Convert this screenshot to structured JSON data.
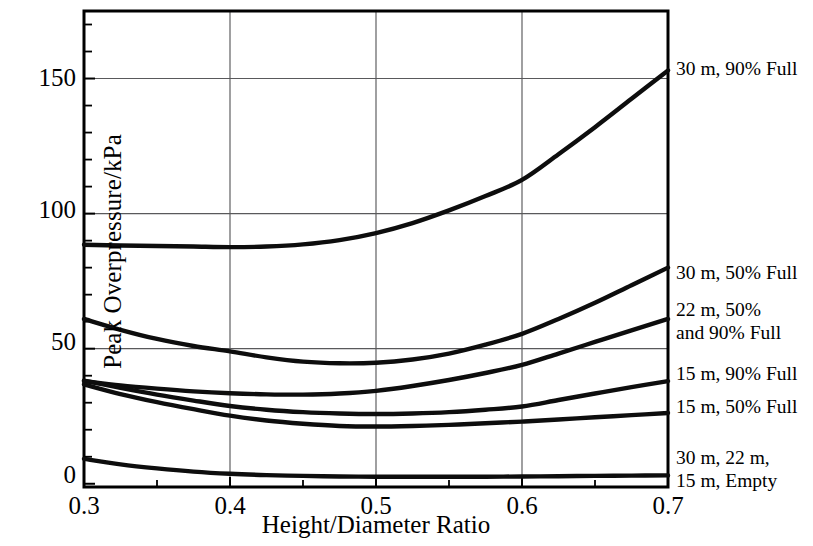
{
  "chart_data": {
    "type": "line",
    "title": "",
    "xlabel": "Height/Diameter Ratio",
    "ylabel": "Peak Overpressure/kPa",
    "xlim": [
      0.3,
      0.7
    ],
    "ylim": [
      -1.2,
      175
    ],
    "xticks": [
      0.3,
      0.4,
      0.5,
      0.6,
      0.7
    ],
    "xtick_labels": [
      "0.3",
      "0.4",
      "0.5",
      "0.6",
      "0.7"
    ],
    "yticks": [
      0,
      50,
      100,
      150
    ],
    "ytick_labels": [
      "0",
      "50",
      "100",
      "150"
    ],
    "y_minor_tick_step": 10,
    "grid": "horizontal-and-vertical",
    "legend_position": "right-of-axes-inline-annotations",
    "x": [
      0.3,
      0.325,
      0.35,
      0.375,
      0.4,
      0.425,
      0.45,
      0.475,
      0.5,
      0.525,
      0.55,
      0.575,
      0.6,
      0.625,
      0.65,
      0.675,
      0.7
    ],
    "series": [
      {
        "name": "30 m, 90% Full",
        "label": "30 m, 90% Full",
        "values": [
          88.5,
          88.2,
          88.0,
          87.8,
          87.6,
          87.8,
          88.6,
          90.2,
          92.8,
          96.5,
          101.2,
          106.5,
          112.5,
          122.0,
          132.0,
          142.5,
          153.0
        ]
      },
      {
        "name": "30 m, 50% Full",
        "label": "30 m, 50% Full",
        "values": [
          61.0,
          57.0,
          53.6,
          51.0,
          49.0,
          46.8,
          45.2,
          44.6,
          44.8,
          46.0,
          48.2,
          51.5,
          55.5,
          61.0,
          67.0,
          73.5,
          80.0
        ]
      },
      {
        "name": "22 m, 50%\nand 90% Full",
        "label_lines": [
          "22 m, 50%",
          "and 90% Full"
        ],
        "values": [
          38.0,
          36.4,
          35.2,
          34.2,
          33.5,
          33.1,
          33.0,
          33.4,
          34.4,
          36.2,
          38.4,
          41.0,
          44.0,
          48.2,
          52.5,
          56.8,
          61.0
        ]
      },
      {
        "name": "15 m, 90% Full",
        "label": "15 m, 90% Full",
        "values": [
          38.2,
          35.5,
          33.0,
          30.8,
          28.8,
          27.4,
          26.5,
          26.0,
          25.8,
          26.0,
          26.5,
          27.4,
          28.6,
          31.0,
          33.4,
          35.8,
          38.0
        ]
      },
      {
        "name": "15 m, 50% Full",
        "label": "15 m, 50% Full",
        "values": [
          36.8,
          33.2,
          30.2,
          27.6,
          25.2,
          23.4,
          22.2,
          21.4,
          21.2,
          21.4,
          21.8,
          22.4,
          23.0,
          23.8,
          24.6,
          25.4,
          26.2
        ]
      },
      {
        "name": "30 m, 22 m, 15 m, Empty",
        "label_lines": [
          "30 m, 22 m,",
          "15 m, Empty"
        ],
        "values": [
          9.2,
          7.2,
          5.7,
          4.5,
          3.7,
          3.2,
          2.9,
          2.7,
          2.6,
          2.6,
          2.6,
          2.6,
          2.7,
          2.8,
          2.9,
          3.0,
          3.1
        ]
      }
    ],
    "annotations": [
      {
        "text": "30 m, 90% Full",
        "at_y": 153.0
      },
      {
        "text": "30 m, 50% Full",
        "at_y": 80.0
      },
      {
        "text": "22 m, 50% and 90% Full",
        "at_y": 61.0
      },
      {
        "text": "15 m, 90% Full",
        "at_y": 38.0
      },
      {
        "text": "15 m, 50% Full",
        "at_y": 26.2
      },
      {
        "text": "30 m, 22 m, 15 m, Empty",
        "at_y": 3.1
      }
    ]
  },
  "axes": {
    "y_title": "Peak Overpressure/kPa",
    "x_title": "Height/Diameter Ratio",
    "y_tick_labels": [
      "150",
      "100",
      "50",
      "0"
    ],
    "x_tick_labels": [
      "0.3",
      "0.4",
      "0.5",
      "0.6",
      "0.7"
    ]
  },
  "labels": {
    "s1": "30 m, 90% Full",
    "s2": "30 m, 50% Full",
    "s3_line1": "22 m, 50%",
    "s3_line2": "and 90% Full",
    "s4": "15 m, 90% Full",
    "s5": "15 m, 50% Full",
    "s6_line1": "30 m, 22 m,",
    "s6_line2": "15 m, Empty"
  },
  "colors": {
    "curve": "#0d0d0d",
    "frame": "#000000",
    "gridline": "#59595b",
    "background": "#ffffff"
  }
}
